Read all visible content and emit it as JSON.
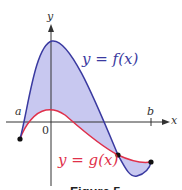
{
  "figure": {
    "caption": "Figure 5",
    "axes": {
      "x_label": "x",
      "y_label": "y",
      "origin_label": "0",
      "a_label": "a",
      "b_label": "b"
    },
    "curves": {
      "f": {
        "label": "y = f(x)",
        "color": "#3a3aa0"
      },
      "g": {
        "label": "y = g(x)",
        "color": "#e0304a"
      }
    },
    "fill_color": "#c8c8f0",
    "points": [
      {
        "name": "left-endpoint",
        "at": "x = a"
      },
      {
        "name": "intersection",
        "at": "f(x) = g(x)"
      },
      {
        "name": "right-endpoint",
        "at": "x = b"
      }
    ]
  }
}
